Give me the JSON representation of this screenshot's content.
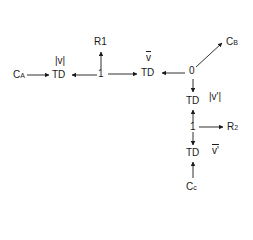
{
  "diagram": {
    "type": "bond-graph",
    "nodes": {
      "ca": {
        "main": "C",
        "sub": "A"
      },
      "td1": {
        "label": "TD",
        "annotation": "|v|"
      },
      "j1a": {
        "label": "1"
      },
      "r1": {
        "label": "R1"
      },
      "td2": {
        "label": "TD",
        "annotation": "v"
      },
      "j0": {
        "label": "0"
      },
      "cb": {
        "main": "C",
        "sub": "B"
      },
      "td3": {
        "label": "TD",
        "annotation": "|v'|"
      },
      "j1b": {
        "label": "1"
      },
      "r2": {
        "main": "R",
        "sub": "2"
      },
      "td4": {
        "label": "TD",
        "annotation": "v'"
      },
      "cc": {
        "main": "C",
        "sub": "c"
      }
    },
    "edges": [
      {
        "from": "C_A",
        "to": "TD(|v|)"
      },
      {
        "from": "1",
        "to": "TD(|v|)"
      },
      {
        "from": "1",
        "to": "R1"
      },
      {
        "from": "1",
        "to": "TD(v̄)"
      },
      {
        "from": "0",
        "to": "TD(v̄)"
      },
      {
        "from": "0",
        "to": "C_B"
      },
      {
        "from": "0",
        "to": "TD(|v'|)"
      },
      {
        "from": "1'",
        "to": "TD(|v'|)"
      },
      {
        "from": "1'",
        "to": "R_2"
      },
      {
        "from": "1'",
        "to": "TD(v̄')"
      },
      {
        "from": "C_c",
        "to": "TD(v̄')"
      }
    ],
    "line_color": "#1a1a1a"
  }
}
